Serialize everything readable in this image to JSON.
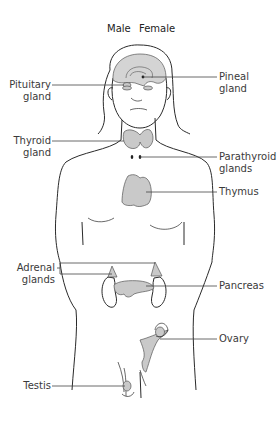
{
  "header": {
    "male_label": "Male",
    "female_label": "Female"
  },
  "labels": {
    "pituitary": {
      "line1": "Pituitary",
      "line2": "gland"
    },
    "pineal": {
      "line1": "Pineal",
      "line2": "gland"
    },
    "thyroid": {
      "line1": "Thyroid",
      "line2": "gland"
    },
    "parathyroid": {
      "line1": "Parathyroid",
      "line2": "glands"
    },
    "thymus": {
      "line1": "Thymus"
    },
    "adrenal": {
      "line1": "Adrenal",
      "line2": "glands"
    },
    "pancreas": {
      "line1": "Pancreas"
    },
    "ovary": {
      "line1": "Ovary"
    },
    "testis": {
      "line1": "Testis"
    }
  },
  "colors": {
    "outline": "#2a2a2a",
    "gland_fill": "#c9c9c9",
    "text": "#3a3a3a"
  }
}
